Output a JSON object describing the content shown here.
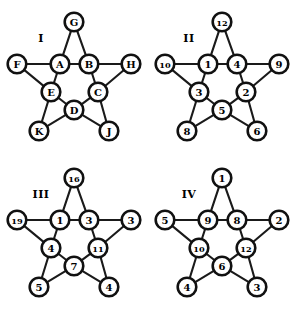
{
  "figure": {
    "name": "four-pentagram-graphs",
    "background": "#ffffff",
    "ink": "#111111",
    "panel_count": 4
  },
  "geometry": {
    "outer": [
      {
        "key": "top",
        "x": 74,
        "y": 22
      },
      {
        "key": "left",
        "x": 17,
        "y": 64
      },
      {
        "key": "right",
        "x": 131,
        "y": 64
      },
      {
        "key": "bottom_left",
        "x": 39,
        "y": 131
      },
      {
        "key": "bottom_right",
        "x": 109,
        "y": 131
      }
    ],
    "inner": [
      {
        "key": "top_left",
        "x": 60,
        "y": 64
      },
      {
        "key": "top_right",
        "x": 89,
        "y": 64
      },
      {
        "key": "mid_left",
        "x": 51,
        "y": 92
      },
      {
        "key": "mid_right",
        "x": 98,
        "y": 92
      },
      {
        "key": "bottom",
        "x": 74,
        "y": 110
      }
    ],
    "node_radius": 9.3,
    "numeral_pos": {
      "x": 41,
      "y": 38
    }
  },
  "edges": [
    [
      "top",
      "top_left"
    ],
    [
      "top",
      "top_right"
    ],
    [
      "left",
      "top_left"
    ],
    [
      "left",
      "mid_left"
    ],
    [
      "right",
      "top_right"
    ],
    [
      "right",
      "mid_right"
    ],
    [
      "bottom_left",
      "mid_left"
    ],
    [
      "bottom_left",
      "bottom"
    ],
    [
      "bottom_right",
      "mid_right"
    ],
    [
      "bottom_right",
      "bottom"
    ],
    [
      "top_left",
      "top_right"
    ],
    [
      "top_left",
      "mid_left"
    ],
    [
      "top_right",
      "mid_right"
    ],
    [
      "mid_left",
      "bottom"
    ],
    [
      "mid_right",
      "bottom"
    ]
  ],
  "panels": [
    {
      "id": "I",
      "numeral": "I",
      "labels": {
        "top": "G",
        "left": "F",
        "right": "H",
        "bottom_left": "K",
        "bottom_right": "J",
        "top_left": "A",
        "top_right": "B",
        "mid_left": "E",
        "mid_right": "C",
        "bottom": "D"
      }
    },
    {
      "id": "II",
      "numeral": "II",
      "labels": {
        "top": "12",
        "left": "10",
        "right": "9",
        "bottom_left": "8",
        "bottom_right": "6",
        "top_left": "1",
        "top_right": "4",
        "mid_left": "3",
        "mid_right": "2",
        "bottom": "5"
      }
    },
    {
      "id": "III",
      "numeral": "III",
      "labels": {
        "top": "16",
        "left": "19",
        "right": "3",
        "bottom_left": "5",
        "bottom_right": "4",
        "top_left": "1",
        "top_right": "3",
        "mid_left": "4",
        "mid_right": "11",
        "bottom": "7"
      }
    },
    {
      "id": "IV",
      "numeral": "IV",
      "labels": {
        "top": "1",
        "left": "5",
        "right": "2",
        "bottom_left": "4",
        "bottom_right": "3",
        "top_left": "9",
        "top_right": "8",
        "mid_left": "10",
        "mid_right": "12",
        "bottom": "6"
      }
    }
  ]
}
